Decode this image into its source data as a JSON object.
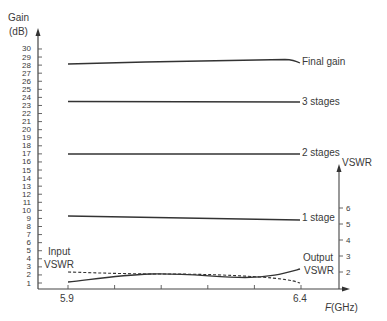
{
  "chart_data": {
    "type": "line",
    "title": "",
    "xlabel": "F(GHz)",
    "ylabel": "Gain (dB)",
    "y2label": "VSWR",
    "x_ticks_labeled": [
      "5.9",
      "6.4"
    ],
    "x_range": [
      5.9,
      6.4
    ],
    "x_minor_step": 0.1,
    "ylim": [
      0,
      30
    ],
    "y_ticks": [
      1,
      2,
      3,
      4,
      5,
      6,
      7,
      8,
      9,
      10,
      11,
      12,
      13,
      14,
      15,
      16,
      17,
      18,
      19,
      20,
      21,
      22,
      23,
      24,
      25,
      26,
      27,
      28,
      29,
      30
    ],
    "y2lim": [
      1,
      7
    ],
    "y2_ticks": [
      2,
      3,
      4,
      5,
      6
    ],
    "grid": false,
    "series": [
      {
        "name": "Final gain",
        "axis": "gain",
        "style": "solid",
        "x": [
          5.9,
          6.0,
          6.1,
          6.2,
          6.3,
          6.35,
          6.4
        ],
        "values": [
          28.1,
          28.2,
          28.35,
          28.45,
          28.6,
          28.6,
          28.2
        ]
      },
      {
        "name": "3 stages",
        "axis": "gain",
        "style": "solid",
        "x": [
          5.9,
          6.4
        ],
        "values": [
          23.4,
          23.4
        ]
      },
      {
        "name": "2 stages",
        "axis": "gain",
        "style": "solid",
        "x": [
          5.9,
          6.4
        ],
        "values": [
          16.8,
          16.8
        ]
      },
      {
        "name": "1 stage",
        "axis": "gain",
        "style": "solid",
        "x": [
          5.9,
          6.0,
          6.1,
          6.2,
          6.3,
          6.4
        ],
        "values": [
          9.0,
          8.9,
          8.8,
          8.7,
          8.6,
          8.5
        ]
      },
      {
        "name": "Input VSWR",
        "axis": "vswr",
        "style": "dashed",
        "x": [
          5.9,
          6.0,
          6.1,
          6.2,
          6.3,
          6.4
        ],
        "values": [
          2.0,
          1.85,
          1.8,
          1.6,
          1.45,
          1.05
        ]
      },
      {
        "name": "Output VSWR",
        "axis": "vswr",
        "style": "solid",
        "x": [
          5.9,
          6.0,
          6.1,
          6.2,
          6.3,
          6.4
        ],
        "values": [
          1.2,
          1.75,
          1.85,
          1.6,
          1.7,
          2.2
        ]
      }
    ],
    "annotations": [
      "Final gain",
      "3 stages",
      "2 stages",
      "1 stage",
      "Input VSWR",
      "Output VSWR"
    ]
  },
  "labels": {
    "gain_axis_line1": "Gain",
    "gain_axis_line2": "(dB)",
    "vswr_axis": "VSWR",
    "x_axis": "F(GHz)",
    "x_start": "5.9",
    "x_end": "6.4",
    "final_gain": "Final gain",
    "three_stages": "3 stages",
    "two_stages": "2 stages",
    "one_stage": "1 stage",
    "input_vswr_1": "Input",
    "input_vswr_2": "VSWR",
    "output_vswr_1": "Output",
    "output_vswr_2": "VSWR"
  },
  "y_tick_labels": [
    "30",
    "29",
    "28",
    "27",
    "26",
    "25",
    "24",
    "23",
    "22",
    "21",
    "20",
    "19",
    "18",
    "17",
    "16",
    "15",
    "14",
    "13",
    "12",
    "11",
    "10",
    "9",
    "8",
    "7",
    "6",
    "5",
    "4",
    "3",
    "2",
    "1"
  ],
  "y2_tick_labels": [
    "6",
    "5",
    "4",
    "3",
    "2"
  ]
}
